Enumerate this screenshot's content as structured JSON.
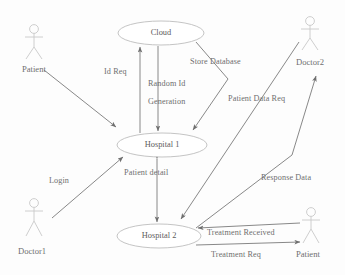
{
  "diagram": {
    "background_color": "#fdfdfd",
    "line_color": "#7b7b7b",
    "node_stroke_color": "#bdbdbd",
    "text_color": "#6f6f6f",
    "actors": [
      {
        "id": "patient-left",
        "label": "Patient",
        "x": 22,
        "y": 64
      },
      {
        "id": "doctor1",
        "label": "Doctor1",
        "x": 18,
        "y": 246
      },
      {
        "id": "doctor2",
        "label": "Doctor2",
        "x": 296,
        "y": 57
      },
      {
        "id": "patient-right",
        "label": "Patient",
        "x": 296,
        "y": 249
      }
    ],
    "nodes": [
      {
        "id": "cloud",
        "label": "Cloud",
        "cx": 161,
        "cy": 33,
        "rx": 43,
        "ry": 12
      },
      {
        "id": "hospital-1",
        "label": "Hospital 1",
        "cx": 162,
        "cy": 145,
        "rx": 45,
        "ry": 12
      },
      {
        "id": "hospital-2",
        "label": "Hospital 2",
        "cx": 159,
        "cy": 236,
        "rx": 42,
        "ry": 12
      }
    ],
    "edge_labels": [
      {
        "id": "id-req",
        "label": "Id Req",
        "x": 104,
        "y": 68
      },
      {
        "id": "random-id",
        "label": "Random Id",
        "x": 148,
        "y": 80
      },
      {
        "id": "generation",
        "label": "Generation",
        "x": 148,
        "y": 98
      },
      {
        "id": "store-database",
        "label": "Store Database",
        "x": 190,
        "y": 58
      },
      {
        "id": "patient-data-req",
        "label": "Patient Data Req",
        "x": 228,
        "y": 95
      },
      {
        "id": "response-data",
        "label": "Response Data",
        "x": 261,
        "y": 174
      },
      {
        "id": "login",
        "label": "Login",
        "x": 49,
        "y": 177
      },
      {
        "id": "patient-detail",
        "label": "Patient detail",
        "x": 124,
        "y": 169
      },
      {
        "id": "treatment-received",
        "label": "Treatment Received",
        "x": 207,
        "y": 229
      },
      {
        "id": "treatment-req",
        "label": "Treatment Req",
        "x": 211,
        "y": 251
      }
    ],
    "relationships": [
      {
        "from": "patient-left",
        "to": "hospital-1",
        "label": ""
      },
      {
        "from": "hospital-1",
        "to": "cloud",
        "label": "Id Req"
      },
      {
        "from": "cloud",
        "to": "hospital-1",
        "label": "Random Id Generation"
      },
      {
        "from": "cloud",
        "to": "hospital-1",
        "label": "Store Database"
      },
      {
        "from": "doctor2",
        "to": "hospital-2",
        "label": "Patient Data Req"
      },
      {
        "from": "hospital-2",
        "to": "doctor2",
        "label": "Response Data"
      },
      {
        "from": "doctor1",
        "to": "hospital-1",
        "label": "Login"
      },
      {
        "from": "hospital-1",
        "to": "hospital-2",
        "label": "Patient detail"
      },
      {
        "from": "patient-right",
        "to": "hospital-2",
        "label": "Treatment Received"
      },
      {
        "from": "hospital-2",
        "to": "patient-right",
        "label": "Treatment Req"
      }
    ]
  }
}
